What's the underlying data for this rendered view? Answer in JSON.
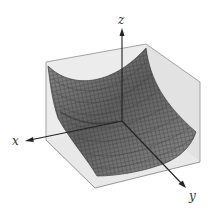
{
  "figure": {
    "type": "3d-surface-plot",
    "axes": {
      "x_label": "x",
      "y_label": "y",
      "z_label": "z"
    },
    "colors": {
      "background": "#ffffff",
      "box_face": "#e6e6e6",
      "box_edge": "#8c8c8c",
      "surface_fill": "#7a7a7a",
      "surface_grid": "#3a3a3a",
      "axis": "#222222"
    }
  }
}
